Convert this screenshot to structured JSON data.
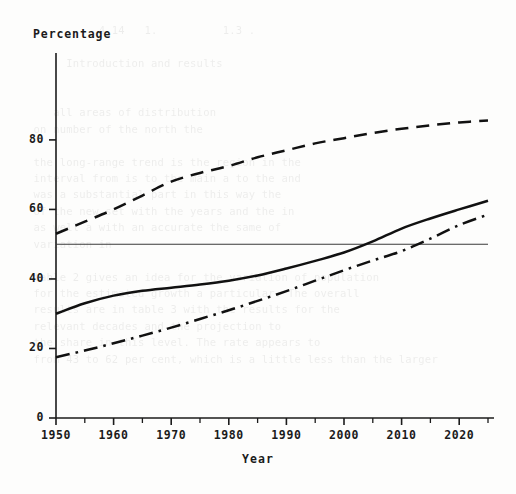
{
  "chart_data": {
    "type": "line",
    "title": "",
    "xlabel": "Year",
    "ylabel": "Percentage",
    "xlim": [
      1950,
      2025
    ],
    "ylim": [
      0,
      105
    ],
    "grid": false,
    "legend": "none",
    "x_ticks": [
      "1950",
      "1960",
      "1970",
      "1980",
      "1990",
      "2000",
      "2010",
      "2020"
    ],
    "x_tick_values": [
      1950,
      1960,
      1970,
      1980,
      1990,
      2000,
      2010,
      2020
    ],
    "x_minor_step": 5,
    "y_ticks": [
      "0",
      "20",
      "40",
      "60",
      "80"
    ],
    "y_tick_values": [
      0,
      20,
      40,
      60,
      80
    ],
    "reference_lines": [
      {
        "name": "fifty-percent-line",
        "orientation": "horizontal",
        "value": 50,
        "style": "solid-thin"
      }
    ],
    "x": [
      1950,
      1955,
      1960,
      1965,
      1970,
      1975,
      1980,
      1985,
      1990,
      1995,
      2000,
      2005,
      2010,
      2015,
      2020,
      2025
    ],
    "series": [
      {
        "name": "dashed-series",
        "style": "dashed",
        "color": "#111111",
        "values": [
          53.0,
          56.5,
          60.0,
          64.0,
          68.0,
          70.5,
          72.5,
          75.0,
          77.0,
          79.0,
          80.5,
          82.0,
          83.2,
          84.2,
          85.0,
          85.6
        ]
      },
      {
        "name": "solid-series",
        "style": "solid",
        "color": "#111111",
        "values": [
          30.0,
          33.0,
          35.2,
          36.6,
          37.5,
          38.4,
          39.5,
          41.0,
          43.0,
          45.2,
          47.6,
          50.8,
          54.5,
          57.4,
          60.0,
          62.5
        ]
      },
      {
        "name": "dash-dot-series",
        "style": "dashdot",
        "color": "#111111",
        "values": [
          17.5,
          19.4,
          21.5,
          23.7,
          26.0,
          28.5,
          31.0,
          33.7,
          36.5,
          39.5,
          42.5,
          45.3,
          48.0,
          51.6,
          55.5,
          58.5
        ]
      }
    ],
    "crossings": [
      {
        "name": "solid-crosses-fifty",
        "x": 2004,
        "y": 50
      },
      {
        "name": "dashdot-crosses-fifty",
        "x": 2015,
        "y": 50
      }
    ]
  },
  "background_text": "                                                                  \n             4.14   1.          1.3 .                             \n                                                                  \n        Introduction and results                                  \n                                                                  \n                                                                  \n      all areas of distribution                                   \n   on number of the north the                                     \n                                                                  \n   the long-range trend is the region in the                      \n   interval from is to the main a to the and                      \n   was a substantial part in this way the                         \n   of the new set with the years and the in                       \n   as well a with an accurate the same of                         \n   variation in                                                   \n                                                                  \n   table 2 gives an idea for the variation of population          \n   for the estimated growth a particular. The overall             \n   results are in table 3 with the results for the                \n   relevant decades and the projection to                         \n   the share in this level. The rate appears to                   \n   from 43 to 62 per cent, which is a little less than the larger \n"
}
